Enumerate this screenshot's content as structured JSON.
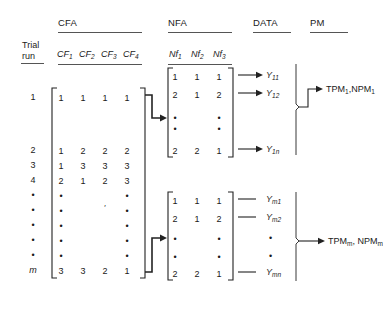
{
  "figure": {
    "type": "experimental-design-diagram",
    "groups": [
      {
        "name": "CFA",
        "label": "CFA"
      },
      {
        "name": "NFA",
        "label": "NFA"
      },
      {
        "name": "DATA",
        "label": "DATA"
      },
      {
        "name": "PM",
        "label": "PM"
      }
    ],
    "row_header": {
      "line1": "Trial",
      "line2": "run"
    },
    "cfa_columns": [
      {
        "base": "CF",
        "sub": "1"
      },
      {
        "base": "CF",
        "sub": "2"
      },
      {
        "base": "CF",
        "sub": "3"
      },
      {
        "base": "CF",
        "sub": "4"
      }
    ],
    "nfa_columns": [
      {
        "base": "Nf",
        "sub": "1"
      },
      {
        "base": "Nf",
        "sub": "2"
      },
      {
        "base": "Nf",
        "sub": "3"
      }
    ],
    "trial_runs": [
      "1",
      "2",
      "3",
      "4",
      "•",
      "•",
      "•",
      "•",
      "•",
      "m"
    ],
    "cfa_matrix": [
      [
        "1",
        "1",
        "1",
        "1"
      ],
      [
        "1",
        "2",
        "2",
        "2"
      ],
      [
        "1",
        "3",
        "3",
        "3"
      ],
      [
        "2",
        "1",
        "2",
        "3"
      ],
      [
        "•",
        "",
        "",
        "•"
      ],
      [
        "•",
        "",
        "′",
        "•"
      ],
      [
        "•",
        "",
        "",
        "•"
      ],
      [
        "•",
        "",
        "",
        "•"
      ],
      [
        "•",
        "",
        "",
        "•"
      ],
      [
        "3",
        "3",
        "2",
        "1"
      ]
    ],
    "nfa_block_top": {
      "rows": [
        [
          "1",
          "1",
          "1"
        ],
        [
          "2",
          "1",
          "2"
        ],
        [
          "•",
          "",
          "•"
        ],
        [
          "•",
          "",
          "•"
        ],
        [
          "2",
          "2",
          "1"
        ]
      ],
      "data_labels": [
        {
          "base": "Y",
          "sub": "11",
          "arrow": true
        },
        {
          "base": "Y",
          "sub": "12",
          "arrow": true
        },
        {
          "base": "",
          "sub": "",
          "arrow": false
        },
        {
          "base": "",
          "sub": "",
          "arrow": false
        },
        {
          "base": "Y",
          "sub": "1n",
          "arrow": true
        }
      ],
      "pm_label": {
        "text": "TPM",
        "sub1": "1",
        "text2": ",NPM",
        "sub2": "1"
      }
    },
    "nfa_block_bottom": {
      "rows": [
        [
          "1",
          "1",
          "1"
        ],
        [
          "2",
          "1",
          "2"
        ],
        [
          "•",
          "",
          "•"
        ],
        [
          "•",
          "",
          "•"
        ],
        [
          "2",
          "2",
          "1"
        ]
      ],
      "data_labels": [
        {
          "base": "Y",
          "sub": "m1",
          "arrow": true
        },
        {
          "base": "Y",
          "sub": "m2",
          "arrow": true
        },
        {
          "base": "•",
          "sub": "",
          "arrow": false
        },
        {
          "base": "•",
          "sub": "",
          "arrow": false
        },
        {
          "base": "Y",
          "sub": "mn",
          "arrow": true
        }
      ],
      "pm_label": {
        "text": "TPM",
        "sub1": "m",
        "text2": ", NPM",
        "sub2": "m"
      }
    },
    "colors": {
      "ink": "#1a1a1a",
      "rule": "#555555",
      "line": "#222222",
      "background": "#ffffff"
    }
  }
}
